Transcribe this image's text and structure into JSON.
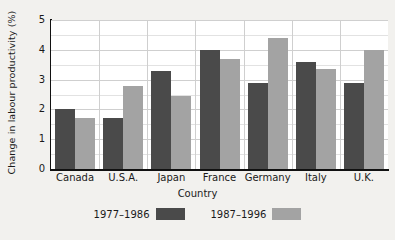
{
  "chart_data": {
    "type": "bar",
    "title": "",
    "xlabel": "Country",
    "ylabel": "Change in labour productivity (%)",
    "categories": [
      "Canada",
      "U.S.A.",
      "Japan",
      "France",
      "Germany",
      "Italy",
      "U.K."
    ],
    "series": [
      {
        "name": "1977–1986",
        "color": "#4a4a4a",
        "values": [
          2.0,
          1.7,
          3.3,
          4.0,
          2.9,
          3.6,
          2.9
        ]
      },
      {
        "name": "1987–1996",
        "color": "#a3a3a3",
        "values": [
          1.7,
          2.8,
          2.45,
          3.7,
          4.4,
          3.35,
          4.0
        ]
      }
    ],
    "ylim": [
      0,
      5
    ],
    "ytick_labels": [
      "0",
      "1",
      "2",
      "3",
      "4",
      "5"
    ],
    "ytick_values": [
      0,
      1,
      2,
      3,
      4,
      5
    ],
    "yminor_values": [
      0.5,
      1.5,
      2.5,
      3.5,
      4.5
    ],
    "grid": "both",
    "legend_position": "bottom"
  }
}
